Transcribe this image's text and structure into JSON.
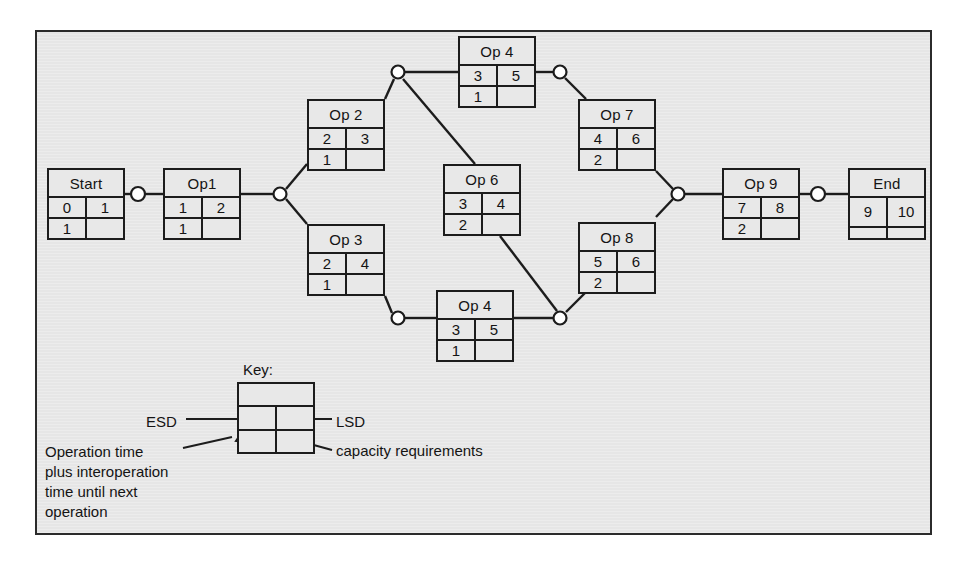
{
  "diagram": {
    "panel_background": "#e8e8e8",
    "line_color": "#1c1c1c",
    "nodes": [
      {
        "id": "start",
        "label": "Start",
        "esd": "0",
        "lsd": "1",
        "op_time": "1",
        "capacity": "",
        "x": 47,
        "y": 168
      },
      {
        "id": "op1",
        "label": "Op1",
        "esd": "1",
        "lsd": "2",
        "op_time": "1",
        "capacity": "",
        "x": 163,
        "y": 168
      },
      {
        "id": "op2",
        "label": "Op 2",
        "esd": "2",
        "lsd": "3",
        "op_time": "1",
        "capacity": "",
        "x": 307,
        "y": 99
      },
      {
        "id": "op3",
        "label": "Op 3",
        "esd": "2",
        "lsd": "4",
        "op_time": "1",
        "capacity": "",
        "x": 307,
        "y": 224
      },
      {
        "id": "op4a",
        "label": "Op 4",
        "esd": "3",
        "lsd": "5",
        "op_time": "1",
        "capacity": "",
        "x": 458,
        "y": 36
      },
      {
        "id": "op4b",
        "label": "Op 4",
        "esd": "3",
        "lsd": "5",
        "op_time": "1",
        "capacity": "",
        "x": 436,
        "y": 290
      },
      {
        "id": "op6",
        "label": "Op 6",
        "esd": "3",
        "lsd": "4",
        "op_time": "2",
        "capacity": "",
        "x": 443,
        "y": 164
      },
      {
        "id": "op7",
        "label": "Op 7",
        "esd": "4",
        "lsd": "6",
        "op_time": "2",
        "capacity": "",
        "x": 578,
        "y": 99
      },
      {
        "id": "op8",
        "label": "Op 8",
        "esd": "5",
        "lsd": "6",
        "op_time": "2",
        "capacity": "",
        "x": 578,
        "y": 222
      },
      {
        "id": "op9",
        "label": "Op 9",
        "esd": "7",
        "lsd": "8",
        "op_time": "2",
        "capacity": "",
        "x": 722,
        "y": 168
      },
      {
        "id": "end",
        "label": "End",
        "esd": "9",
        "lsd": "10",
        "op_time": "",
        "capacity": "",
        "x": 848,
        "y": 168
      }
    ],
    "junctions": [
      {
        "id": "j-start-op1",
        "x": 138,
        "y": 194
      },
      {
        "id": "j-op1-split",
        "x": 280,
        "y": 194
      },
      {
        "id": "j-op2-split",
        "x": 398,
        "y": 72
      },
      {
        "id": "j-op3-split",
        "x": 398,
        "y": 318
      },
      {
        "id": "j-op4a-op7",
        "x": 560,
        "y": 72
      },
      {
        "id": "j-lower-merge",
        "x": 560,
        "y": 318
      },
      {
        "id": "j-op9-merge",
        "x": 678,
        "y": 194
      },
      {
        "id": "j-op9-end",
        "x": 818,
        "y": 194
      }
    ]
  },
  "key": {
    "title": "Key:",
    "esd_label": "ESD",
    "lsd_label": "LSD",
    "capacity_label": "capacity requirements",
    "operation_time_label": "Operation time\nplus interoperation\ntime until next\noperation"
  }
}
